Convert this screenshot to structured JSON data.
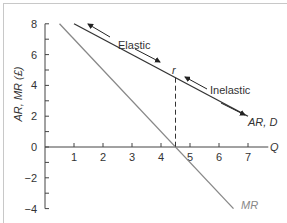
{
  "chart_data": {
    "type": "line",
    "title": "",
    "xlabel": "Q",
    "ylabel": "AR, MR (£)",
    "xlim": [
      0,
      7.7
    ],
    "ylim": [
      -4,
      8
    ],
    "xticks": [
      1,
      2,
      3,
      4,
      5,
      6,
      7
    ],
    "yticks": [
      -4,
      -2,
      0,
      2,
      4,
      6,
      8
    ],
    "grid": false,
    "series": [
      {
        "name": "AR, D",
        "color": "#333333",
        "x": [
          1,
          7
        ],
        "y": [
          8,
          2
        ]
      },
      {
        "name": "MR",
        "color": "#888888",
        "x": [
          0.5,
          6.5
        ],
        "y": [
          8,
          -4
        ]
      }
    ],
    "annotations": {
      "point_label": "r",
      "point": {
        "x": 4.5,
        "y": 4.5
      },
      "elastic_label": "Elastic",
      "inelastic_label": "Inelastic",
      "ar_label": "AR, D",
      "mr_label": "MR",
      "dashed_drop_x": 4.5
    }
  }
}
